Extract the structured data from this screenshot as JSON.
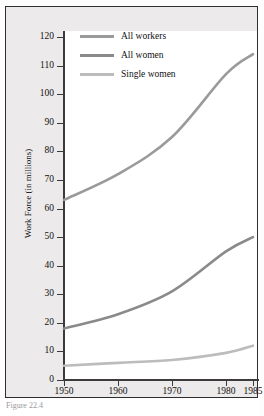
{
  "figure": {
    "caption": "Figure 22.4"
  },
  "legend": {
    "position": "top-left-inside",
    "items": [
      {
        "label": "All workers",
        "color": "#9a9a9a",
        "thickness": 3
      },
      {
        "label": "All women",
        "color": "#8a8a8a",
        "thickness": 3
      },
      {
        "label": "Single women",
        "color": "#bcbcbc",
        "thickness": 3
      }
    ]
  },
  "axes": {
    "y_title": "Work Force (in millions)",
    "y_ticks": [
      "120",
      "110",
      "100",
      "90",
      "80",
      "70",
      "60",
      "50",
      "40",
      "30",
      "20",
      "10",
      "0"
    ],
    "x_ticks": [
      "1950",
      "1960",
      "1970",
      "1980",
      "1985"
    ]
  },
  "chart_data": {
    "type": "line",
    "title": "",
    "subtitle": "",
    "xlabel": "",
    "ylabel": "Work Force (in millions)",
    "x": [
      1950,
      1960,
      1970,
      1980,
      1985
    ],
    "xlim": [
      1950,
      1985
    ],
    "ylim": [
      0,
      120
    ],
    "ytick_step": 10,
    "grid": false,
    "legend_position": "upper left (inside plot)",
    "annotations": [
      "Figure 22.4"
    ],
    "series": [
      {
        "name": "All workers",
        "color": "#9a9a9a",
        "values": [
          63,
          72,
          85,
          107,
          114
        ]
      },
      {
        "name": "All women",
        "color": "#8a8a8a",
        "values": [
          18,
          23,
          31,
          45,
          50
        ]
      },
      {
        "name": "Single women",
        "color": "#bcbcbc",
        "values": [
          5,
          6,
          7,
          9.5,
          12
        ]
      }
    ]
  }
}
